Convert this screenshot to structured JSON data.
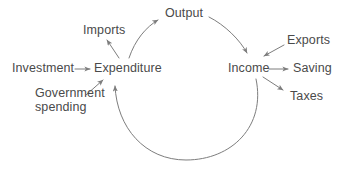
{
  "diagram": {
    "type": "flow-diagram",
    "style": {
      "background": "#ffffff",
      "line_color": "#7d7d7d",
      "text_color": "#4a4a4a",
      "line_width": 1
    },
    "nodes": [
      {
        "id": "investment",
        "label": "Investment",
        "x": 12,
        "y": 62
      },
      {
        "id": "expenditure",
        "label": "Expenditure",
        "x": 94,
        "y": 62
      },
      {
        "id": "imports",
        "label": "Imports",
        "x": 83,
        "y": 24
      },
      {
        "id": "output",
        "label": "Output",
        "x": 165,
        "y": 7
      },
      {
        "id": "income",
        "label": "Income",
        "x": 228,
        "y": 62
      },
      {
        "id": "exports",
        "label": "Exports",
        "x": 287,
        "y": 34
      },
      {
        "id": "saving",
        "label": "Saving",
        "x": 293,
        "y": 62
      },
      {
        "id": "taxes",
        "label": "Taxes",
        "x": 290,
        "y": 90
      },
      {
        "id": "government-spending",
        "label": "Government\nspending",
        "x": 35,
        "y": 87
      }
    ],
    "edges": [
      {
        "id": "investment-to-expenditure",
        "from": "investment",
        "to": "expenditure",
        "shape": "straight"
      },
      {
        "id": "government-spending-to-expenditure",
        "from": "government-spending",
        "to": "expenditure",
        "shape": "straight"
      },
      {
        "id": "expenditure-to-imports",
        "from": "expenditure",
        "to": "imports",
        "shape": "straight"
      },
      {
        "id": "expenditure-to-output",
        "from": "expenditure",
        "to": "output",
        "shape": "arc"
      },
      {
        "id": "output-to-income",
        "from": "output",
        "to": "income",
        "shape": "arc"
      },
      {
        "id": "exports-to-income",
        "from": "exports",
        "to": "income",
        "shape": "straight"
      },
      {
        "id": "income-to-saving",
        "from": "income",
        "to": "saving",
        "shape": "straight"
      },
      {
        "id": "income-to-taxes",
        "from": "income",
        "to": "taxes",
        "shape": "straight"
      },
      {
        "id": "income-to-expenditure",
        "from": "income",
        "to": "expenditure",
        "shape": "arc"
      }
    ]
  }
}
